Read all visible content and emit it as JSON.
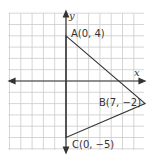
{
  "diagram": {
    "type": "coordinate-plane-triangle",
    "axes": {
      "x_label": "x",
      "y_label": "y"
    },
    "grid": {
      "x_min": -5,
      "x_max": 7,
      "y_min": -6,
      "y_max": 6,
      "step": 1
    },
    "points": [
      {
        "name": "A",
        "x": 0,
        "y": 4,
        "label": "A(0, 4)"
      },
      {
        "name": "B",
        "x": 7,
        "y": -2,
        "label": "B(7, −2)"
      },
      {
        "name": "C",
        "x": 0,
        "y": -5,
        "label": "C(0, −5)"
      }
    ],
    "colors": {
      "grid": "#cccccc",
      "lines": "#333333",
      "background": "#ffffff"
    }
  }
}
